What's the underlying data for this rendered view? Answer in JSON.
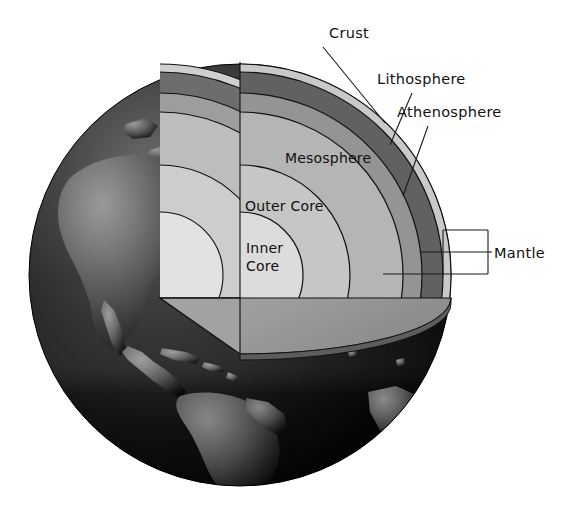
{
  "figure": {
    "background_color": "#ffffff"
  },
  "globe": {
    "name": "earth-globe",
    "center_x": 240,
    "center_y": 275,
    "radius": 211,
    "ocean_color": "#0a0a0a",
    "land_color": "#585858",
    "shadow_color": "#000000",
    "highlight_color": "#6f6f6f",
    "visible_continents": [
      "North America",
      "Central America",
      "Caribbean",
      "South America",
      "Greenland"
    ]
  },
  "cutaway": {
    "name": "quarter-wedge-cutaway",
    "apex_x": 240,
    "apex_y": 62,
    "cut_plane_color": "#8f8f8f",
    "front_face_tint": "#b8b8b8"
  },
  "layers": [
    {
      "id": "crust",
      "label": "Crust",
      "color": "#c9c9c9",
      "outer_radius": 211,
      "inner_radius": 203,
      "face_color": "#d6d6d6"
    },
    {
      "id": "lithosphere",
      "label": "Lithosphere",
      "color": "#616161",
      "outer_radius": 203,
      "inner_radius": 182,
      "face_color": "#707070"
    },
    {
      "id": "athenosphere",
      "label": "Athenosphere",
      "color": "#949494",
      "outer_radius": 182,
      "inner_radius": 163,
      "face_color": "#a3a3a3"
    },
    {
      "id": "mesosphere",
      "label": "Mesosphere",
      "color": "#b5b5b5",
      "outer_radius": 163,
      "inner_radius": 110,
      "face_color": "#c2c2c2"
    },
    {
      "id": "outer-core",
      "label": "Outer Core",
      "color": "#c6c6c6",
      "outer_radius": 110,
      "inner_radius": 63,
      "face_color": "#d0d0d0"
    },
    {
      "id": "inner-core",
      "label": "Inner Core",
      "color": "#dcdcdc",
      "outer_radius": 63,
      "inner_radius": 0,
      "face_color": "#e4e4e4"
    }
  ],
  "labels": {
    "crust": {
      "text": "Crust",
      "x": 329,
      "y": 38,
      "anchor": "start",
      "leader": {
        "x1": 323,
        "y1": 47,
        "x2": 385,
        "y2": 123
      }
    },
    "lithosphere": {
      "text": "Lithosphere",
      "x": 377,
      "y": 84,
      "anchor": "start",
      "leader": {
        "x1": 412,
        "y1": 93,
        "x2": 390,
        "y2": 145
      }
    },
    "athenosphere": {
      "text": "Athenosphere",
      "x": 397,
      "y": 117,
      "anchor": "start",
      "leader": {
        "x1": 428,
        "y1": 126,
        "x2": 403,
        "y2": 196
      }
    },
    "mesosphere": {
      "text": "Mesosphere",
      "x": 285,
      "y": 163,
      "anchor": "start"
    },
    "outer_core": {
      "text": "Outer Core",
      "x": 245,
      "y": 211,
      "anchor": "start"
    },
    "inner_core": {
      "text_line1": "Inner",
      "text_line2": "Core",
      "x": 246,
      "y": 253,
      "anchor": "start"
    },
    "mantle": {
      "text": "Mantle",
      "x": 494,
      "y": 258,
      "anchor": "start",
      "bracket": {
        "left_x": 404,
        "right_x": 488,
        "top_y": 230,
        "mid_y": 252,
        "bottom_y": 274,
        "tick_top_x": 443,
        "tick_bottom_x": 383
      }
    }
  }
}
